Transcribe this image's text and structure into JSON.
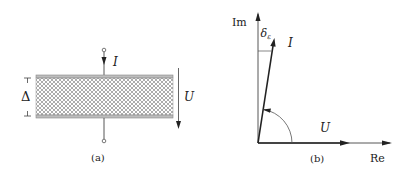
{
  "panel_a": {
    "caption": "(a)",
    "current_label": "I",
    "voltage_label": "U",
    "thickness_label": "Δ"
  },
  "panel_b": {
    "caption": "(b)",
    "imag_axis_label": "Im",
    "real_axis_label": "Re",
    "current_label": "I",
    "voltage_label": "U",
    "loss_angle_label": "δ",
    "loss_angle_subscript": "ε"
  },
  "colors": {
    "line": "#222222",
    "hatch": "#888888",
    "plate": "#999999"
  }
}
